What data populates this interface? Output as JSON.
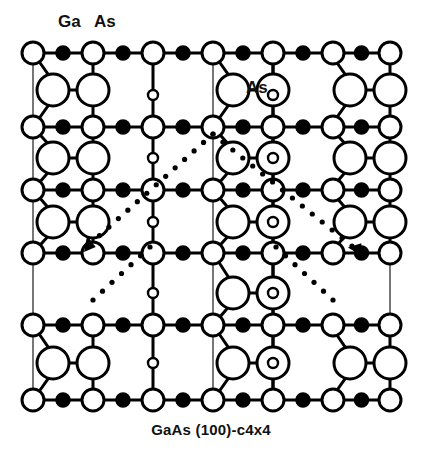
{
  "figure": {
    "caption": "GaAs (100)-c4x4",
    "caption_y": 428,
    "width": 422,
    "height": 460,
    "background": "#ffffff",
    "stroke_color": "#000000",
    "fill_open": "#ffffff",
    "fill_solid": "#000000"
  },
  "labels": [
    {
      "name": "label-ga-top",
      "text": "Ga",
      "x": 58,
      "y": 22,
      "kind": "ga"
    },
    {
      "name": "label-as-top",
      "text": "As",
      "x": 94,
      "y": 22,
      "kind": "as"
    },
    {
      "name": "label-as-middle",
      "text": "As",
      "x": 246,
      "y": 78,
      "kind": "as-mid"
    }
  ],
  "legend_meaning": {
    "small_filled_circle": "Ga",
    "small_open_circle": "As",
    "large_open_circle": "As dimer atom"
  },
  "lattice": {
    "columns_x": [
      33,
      93,
      153,
      213,
      273,
      333,
      390
    ],
    "rows_y": [
      53,
      127,
      190,
      253,
      325,
      400
    ],
    "cell_period_x": 60,
    "open_radius": 11,
    "solid_radius": 7,
    "dimer_radius": 16,
    "tiny_radius": 5,
    "row_line_width": 3.2,
    "bond_width": 3.0,
    "cell_line_width": 1.6
  },
  "cell_boundaries_x": [
    33,
    153,
    213,
    273,
    390
  ],
  "tiny_circle_columns_x": [
    153,
    273
  ],
  "tiny_circle_rows_y": [
    95,
    158,
    222,
    293,
    363
  ],
  "dimer_blocks": [
    {
      "name": "dimer-block",
      "left_x": 53,
      "right_x": 93,
      "y": 90,
      "present": true
    },
    {
      "name": "dimer-block",
      "left_x": 233,
      "right_x": 273,
      "y": 90,
      "present": true
    },
    {
      "name": "dimer-block",
      "left_x": 350,
      "right_x": 390,
      "y": 90,
      "present": true
    },
    {
      "name": "dimer-block",
      "left_x": 53,
      "right_x": 93,
      "y": 158,
      "present": true
    },
    {
      "name": "dimer-block",
      "left_x": 233,
      "right_x": 273,
      "y": 158,
      "present": true
    },
    {
      "name": "dimer-block",
      "left_x": 350,
      "right_x": 390,
      "y": 158,
      "present": true
    },
    {
      "name": "dimer-block",
      "left_x": 53,
      "right_x": 93,
      "y": 222,
      "present": true
    },
    {
      "name": "dimer-block",
      "left_x": 233,
      "right_x": 273,
      "y": 222,
      "present": true
    },
    {
      "name": "dimer-block",
      "left_x": 350,
      "right_x": 390,
      "y": 222,
      "present": true
    },
    {
      "name": "dimer-block",
      "left_x": 233,
      "right_x": 273,
      "y": 293,
      "present": true
    },
    {
      "name": "dimer-block",
      "left_x": 53,
      "right_x": 93,
      "y": 363,
      "present": true
    },
    {
      "name": "dimer-block",
      "left_x": 233,
      "right_x": 273,
      "y": 363,
      "present": true
    },
    {
      "name": "dimer-block",
      "left_x": 350,
      "right_x": 390,
      "y": 363,
      "present": true
    }
  ],
  "missing_dimer_row": {
    "name": "missing-dimer-gap",
    "between_rows_y": [
      253,
      325
    ],
    "empty_spans_x": [
      [
        33,
        153
      ],
      [
        273,
        390
      ]
    ]
  },
  "dotted_guide": {
    "name": "dotted-unit-cell-guide",
    "dot_radius": 2.6,
    "dot_spacing": 13,
    "segments": [
      {
        "name": "dotted-left-leg",
        "x1": 213,
        "y1": 134,
        "x2": 90,
        "y2": 244
      },
      {
        "name": "dotted-right-leg",
        "x1": 213,
        "y1": 134,
        "x2": 352,
        "y2": 246
      },
      {
        "name": "dotted-left-tail",
        "x1": 150,
        "y1": 247,
        "x2": 93,
        "y2": 300
      },
      {
        "name": "dotted-right-tail",
        "x1": 276,
        "y1": 247,
        "x2": 333,
        "y2": 300
      }
    ]
  },
  "arrows": [
    {
      "name": "arrow-left",
      "tip_x": 84,
      "tip_y": 252,
      "angle_deg": 125,
      "size": 15
    },
    {
      "name": "arrow-right",
      "tip_x": 362,
      "tip_y": 256,
      "angle_deg": 55,
      "size": 15
    }
  ]
}
